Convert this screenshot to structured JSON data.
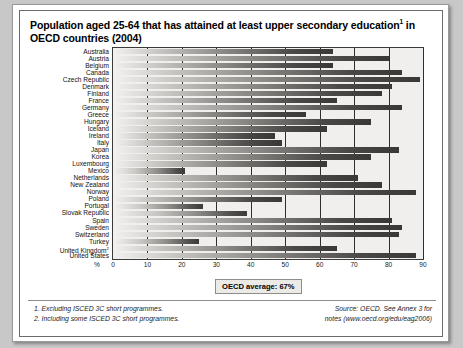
{
  "title": {
    "line1": "Population aged 25-64 that has attained at least upper secondary education",
    "sup1": "1",
    "line1_tail": " in",
    "line2": "OECD countries (2004)"
  },
  "axis": {
    "percent_symbol": "%",
    "ticks": [
      "0",
      "10",
      "20",
      "30",
      "40",
      "50",
      "60",
      "70",
      "80",
      "90"
    ]
  },
  "annotation": {
    "oecd_average": "OECD average: 67%"
  },
  "notes": {
    "note1": "1. Excluding ISCED 3C short programmes.",
    "note2": "2. Including some ISCED 3C short programmes."
  },
  "source": {
    "line1": "Source: OECD. See Annex 3 for",
    "line2": "notes (www.oecd.org/edu/eag2006)"
  },
  "chart_data": {
    "type": "bar",
    "orientation": "horizontal",
    "xlabel": "%",
    "ylabel": "",
    "xlim": [
      0,
      90
    ],
    "xticks": [
      0,
      10,
      20,
      30,
      40,
      50,
      60,
      70,
      80,
      90
    ],
    "grid": true,
    "legend": "none",
    "annotations": [
      "OECD average: 67%"
    ],
    "categories": [
      "Australia",
      "Austria",
      "Belgium",
      "Canada",
      "Czech Republic",
      "Denmark",
      "Finland",
      "France",
      "Germany",
      "Greece",
      "Hungary",
      "Iceland",
      "Ireland",
      "Italy",
      "Japan",
      "Korea",
      "Luxembourg",
      "Mexico",
      "Netherlands",
      "New Zealand",
      "Norway",
      "Poland",
      "Portugal",
      "Slovak Republic",
      "Spain",
      "Sweden",
      "Switzerland",
      "Turkey",
      "United Kingdom",
      "United States"
    ],
    "category_footnotes": {
      "United Kingdom": "2"
    },
    "values": [
      64,
      80,
      64,
      84,
      89,
      81,
      78,
      65,
      84,
      56,
      75,
      62,
      47,
      49,
      83,
      75,
      62,
      21,
      71,
      78,
      88,
      49,
      26,
      39,
      81,
      84,
      83,
      25,
      65,
      88
    ]
  }
}
